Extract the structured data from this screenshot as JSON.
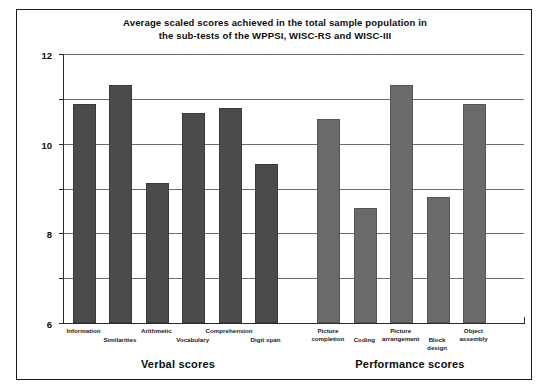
{
  "chart_data": {
    "type": "bar",
    "title": "Average scaled scores achieved in the total sample population in the sub-tests of the WPPSI, WISC-RS and WISC-III",
    "title_line1": "Average scaled scores achieved in the total sample population in",
    "title_line2": "the sub-tests of the WPPSI, WISC-RS and WISC-III",
    "xlabel": "",
    "ylabel": "",
    "ylim": [
      0,
      12
    ],
    "yticks": [
      0,
      2,
      4,
      6,
      8,
      10,
      12
    ],
    "ytick_labels": [
      "0",
      "2",
      "4",
      "6",
      "8",
      "10",
      "12"
    ],
    "grid": true,
    "legend": "none",
    "categories": [
      "Information",
      "Similarities",
      "Arithmetic",
      "Vocabulary",
      "Comprehension",
      "Digit span",
      "Picture completion",
      "Coding",
      "Picture arrangement",
      "Block design",
      "Object assembly"
    ],
    "values": [
      9.75,
      10.6,
      6.25,
      9.35,
      9.6,
      7.1,
      9.1,
      5.15,
      10.6,
      5.6,
      9.75
    ],
    "groups": [
      {
        "label": "Verbal scores",
        "categories": [
          "Information",
          "Similarities",
          "Arithmetic",
          "Vocabulary",
          "Comprehension",
          "Digit span"
        ]
      },
      {
        "label": "Performance scores",
        "categories": [
          "Picture completion",
          "Coding",
          "Picture arrangement",
          "Block design",
          "Object assembly"
        ]
      }
    ],
    "bar_color_verbal": "#4b4b4b",
    "bar_color_performance": "#6a6a6a",
    "gridline_color": "#6e6e6e",
    "axis_color": "#2b2b2b",
    "background": "#ffffff"
  },
  "groups": {
    "verbal": "Verbal scores",
    "performance": "Performance scores"
  }
}
